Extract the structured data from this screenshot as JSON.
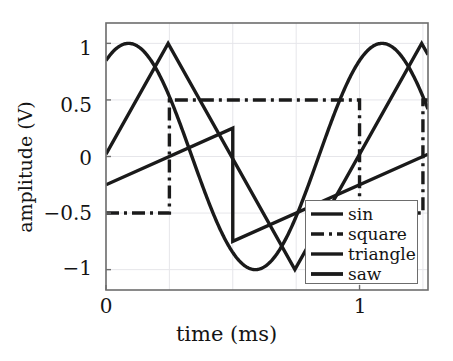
{
  "chart_data": {
    "type": "line",
    "title": "",
    "xlabel": "time (ms)",
    "ylabel": "amplitude (V)",
    "xlim": [
      0,
      1.27
    ],
    "ylim": [
      -1.18,
      1.18
    ],
    "xticks": [
      0,
      1
    ],
    "xtick_labels": [
      "0",
      "1"
    ],
    "yticks": [
      -1,
      -0.5,
      0,
      0.5,
      1
    ],
    "ytick_labels": [
      "−1",
      "−0.5",
      "0",
      "0.5",
      "1"
    ],
    "grid": true,
    "legend_position": "lower right",
    "period_ms": 1.0,
    "series": [
      {
        "name": "sin",
        "label": "sin",
        "style": "solid",
        "color": "#1a1a1a",
        "amplitude": 1.0,
        "phase_deg": 58,
        "description": "sine wave, amplitude 1 V, period 1 ms, starts near 0.85 V rising to peak 1 V at 0.07 ms, minimum -1 V at 0.57 ms"
      },
      {
        "name": "square",
        "label": "square",
        "style": "dashdot",
        "color": "#1a1a1a",
        "amplitude": 0.5,
        "low": -0.5,
        "high": 0.5,
        "description": "square wave between -0.5 V and 0.5 V, rising edge at 0.25 ms, falling edge at 1.0 ms"
      },
      {
        "name": "triangle",
        "label": "triangle",
        "style": "solid",
        "color": "#1a1a1a",
        "amplitude": 1.0,
        "description": "triangle wave amplitude 1 V, starts at 0 V rising to peak 1 V at 0.245 ms, minimum -1 V at 0.745 ms, peak again at 1.245 ms"
      },
      {
        "name": "saw",
        "label": "saw",
        "style": "solid",
        "color": "#1a1a1a",
        "amplitude": 0.5,
        "description": "sawtooth ramp, starts at -0.42 V, rises to 0.25 V at 0.5 ms then resets to -0.75 V, rises to 0.25 V at 1.5 ms"
      }
    ],
    "legend_entries": [
      "sin",
      "square",
      "triangle",
      "saw"
    ]
  },
  "axes": {
    "x_label": "time (ms)",
    "y_label": "amplitude (V)",
    "x_tick_labels": [
      "0",
      "1"
    ],
    "y_tick_labels": [
      "1",
      "0.5",
      "0",
      "−0.5",
      "−1"
    ]
  },
  "legend": {
    "items": [
      {
        "label": "sin",
        "style": "solid"
      },
      {
        "label": "square",
        "style": "dashdot"
      },
      {
        "label": "triangle",
        "style": "solid"
      },
      {
        "label": "saw",
        "style": "solid"
      }
    ]
  },
  "colors": {
    "line": "#1a1a1a",
    "frame": "#6d6d6d",
    "grid": "#e2e2e6",
    "background": "#ffffff",
    "text": "#141414"
  }
}
